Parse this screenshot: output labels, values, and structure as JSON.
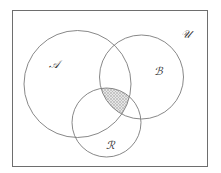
{
  "diagram": {
    "type": "venn",
    "universe": {
      "label": "𝒰",
      "x": 12.5,
      "y": 10.5,
      "width": 195,
      "height": 156,
      "label_x": 186,
      "label_y": 34
    },
    "sets": [
      {
        "id": "A",
        "label": "𝒜",
        "cx": 77.5,
        "cy": 84,
        "r": 53.5,
        "label_x": 54,
        "label_y": 64
      },
      {
        "id": "B",
        "label": "ℬ",
        "cx": 141.5,
        "cy": 77,
        "r": 42,
        "label_x": 158,
        "label_y": 71
      },
      {
        "id": "R",
        "label": "ℛ",
        "cx": 106.5,
        "cy": 122.5,
        "r": 34.5,
        "label_x": 110,
        "label_y": 145
      }
    ],
    "shaded_region": "A ∩ B ∩ R",
    "colors": {
      "stroke": "#7a7a7a",
      "border": "#6e6e6e",
      "shade": "#c4c4c4",
      "background": "#ffffff"
    }
  }
}
